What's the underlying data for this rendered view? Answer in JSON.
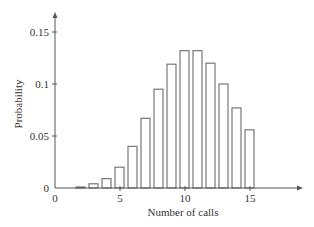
{
  "chart_data": {
    "type": "bar",
    "title": "",
    "xlabel": "Number of calls",
    "ylabel": "Probability",
    "categories": [
      2,
      3,
      4,
      5,
      6,
      7,
      8,
      9,
      10,
      11,
      12,
      13,
      14,
      15
    ],
    "values": [
      0.001,
      0.004,
      0.009,
      0.02,
      0.04,
      0.067,
      0.095,
      0.119,
      0.132,
      0.132,
      0.12,
      0.1,
      0.077,
      0.056
    ],
    "xlim": [
      0,
      19
    ],
    "ylim": [
      0,
      0.168
    ],
    "xticks": [
      0,
      5,
      10,
      15
    ],
    "xtick_labels": [
      "0",
      "5",
      "10",
      "15"
    ],
    "yticks": [
      0,
      0.05,
      0.1,
      0.15
    ],
    "ytick_labels": [
      "0",
      "0.05",
      "0.1",
      "0.15"
    ],
    "grid": false,
    "legend": null,
    "bar_style": "outlined"
  },
  "colors": {
    "bar_fill": "#ffffff",
    "bar_stroke": "#777777",
    "axis": "#555555",
    "text": "#333333"
  }
}
